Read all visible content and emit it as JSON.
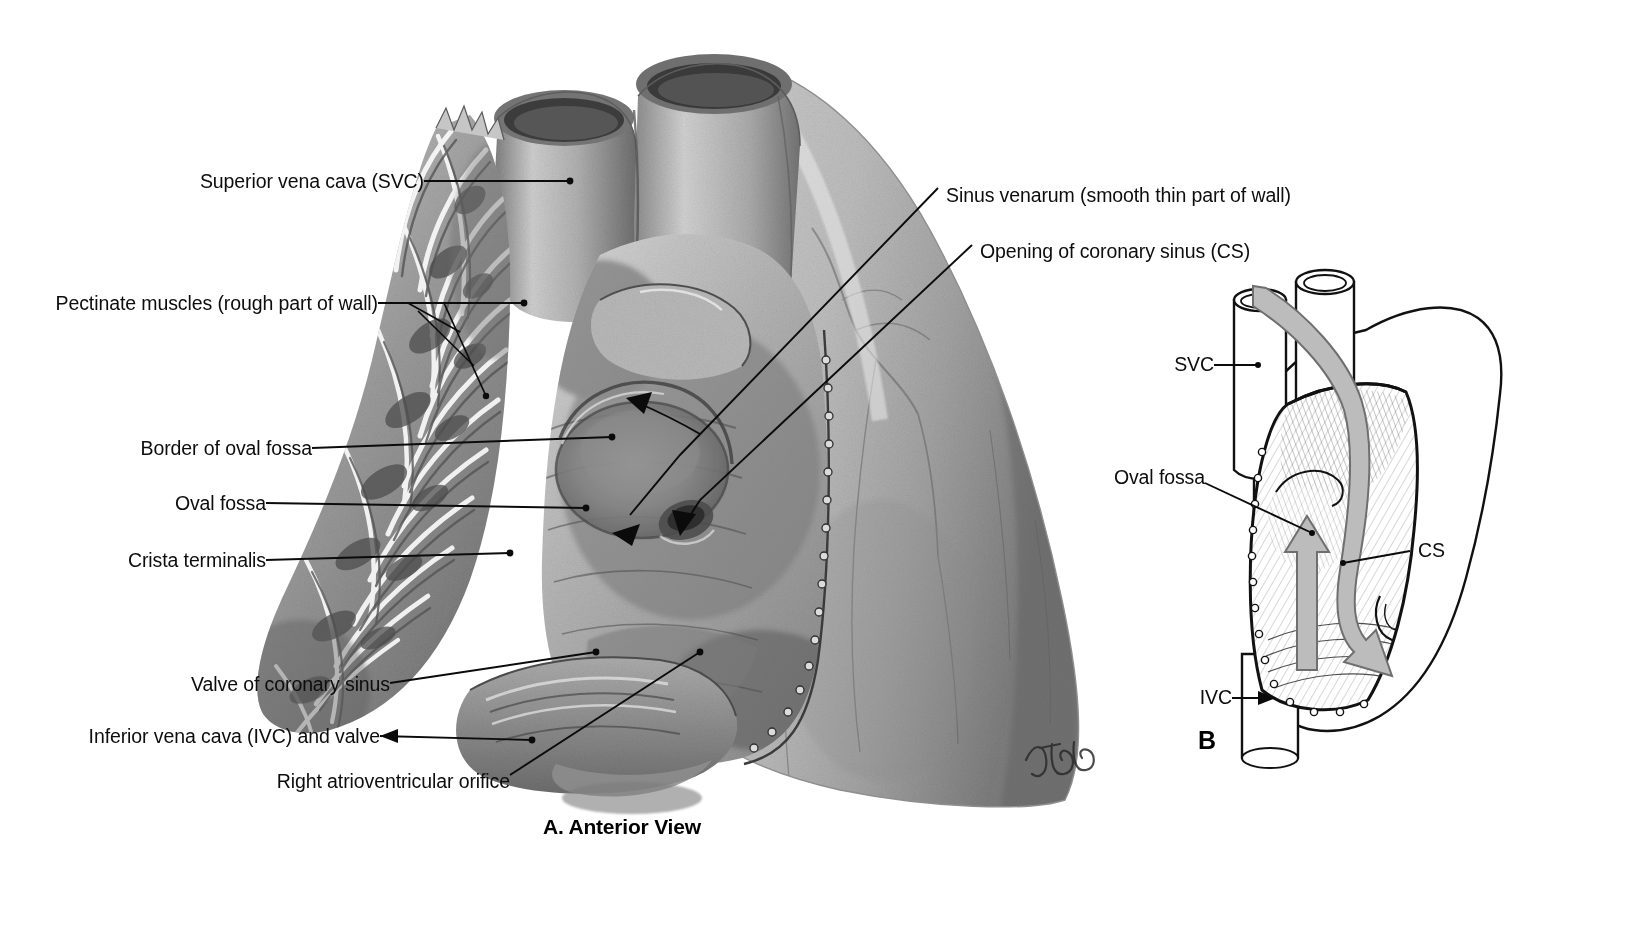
{
  "figure": {
    "signature": "Tubb",
    "panels": [
      {
        "id": "A",
        "caption": "A. Anterior View",
        "letter": "A"
      },
      {
        "id": "B",
        "caption": "B",
        "letter": "B"
      }
    ]
  },
  "panel_a": {
    "caption": "A. Anterior View",
    "labels_left": [
      {
        "key": "svc",
        "text": "Superior vena cava (SVC)"
      },
      {
        "key": "pectinate",
        "text": "Pectinate muscles (rough part of wall)"
      },
      {
        "key": "border_fossa",
        "text": "Border of oval fossa"
      },
      {
        "key": "oval_fossa",
        "text": "Oval fossa"
      },
      {
        "key": "crista",
        "text": "Crista terminalis"
      },
      {
        "key": "valve_cs",
        "text": "Valve of coronary sinus"
      },
      {
        "key": "ivc",
        "text": "Inferior vena cava (IVC) and valve"
      },
      {
        "key": "av_orifice",
        "text": "Right atrioventricular orifice"
      }
    ],
    "labels_right": [
      {
        "key": "sinus_venarum",
        "text": "Sinus venarum (smooth thin part of wall)"
      },
      {
        "key": "opening_cs",
        "text": "Opening of coronary sinus (CS)"
      }
    ]
  },
  "panel_b": {
    "letter": "B",
    "labels": [
      {
        "key": "svc",
        "text": "SVC"
      },
      {
        "key": "oval_fossa",
        "text": "Oval fossa"
      },
      {
        "key": "cs",
        "text": "CS"
      },
      {
        "key": "ivc",
        "text": "IVC"
      }
    ],
    "flow_arrows": [
      {
        "key": "ivc-to-fossa-arrow",
        "description": "upward arrow from IVC toward oval fossa"
      },
      {
        "key": "svc-to-cs-arrow",
        "description": "curved arrow from SVC down to coronary sinus"
      }
    ]
  },
  "colors": {
    "ink": "#0d0d0d",
    "background": "#ffffff",
    "arrow_gray": "#b7b7b7",
    "arrow_gray_edge": "#6f6f6f",
    "tissue_light": "#dcdcdc",
    "tissue_mid": "#a8a8a8",
    "tissue_dark": "#6b6b6b"
  }
}
